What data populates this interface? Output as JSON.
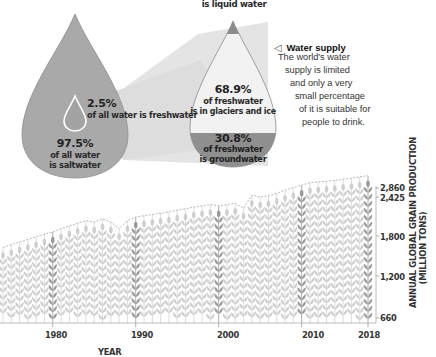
{
  "infographic": {
    "top_label": "is liquid water",
    "big_drop": {
      "freshwater_pct": "2.5%",
      "freshwater_desc": "of all water is freshwater",
      "saltwater_pct": "97.5%",
      "saltwater_desc_1": "of all water",
      "saltwater_desc_2": "is saltwater"
    },
    "fresh_drop": {
      "glaciers_pct": "68.9%",
      "glaciers_desc_1": "of freshwater",
      "glaciers_desc_2": "is in glaciers and ice",
      "ground_pct": "30.8%",
      "ground_desc_1": "of freshwater",
      "ground_desc_2": "is groundwater"
    },
    "water_supply": {
      "icon": "triangle-left-icon",
      "title": "Water supply",
      "lines": [
        "The world's water",
        "supply is limited",
        "and only a very",
        "small percentage",
        "of it is suitable for",
        "people to drink."
      ]
    },
    "colors": {
      "drop_gray": "#a9a9a9",
      "drop_dark": "#8c8c8c",
      "drop_light": "#f2f2f2",
      "funnel": "#e2e2e2",
      "wheat_light": "#cfcfcf",
      "wheat_dark": "#9a9a9a"
    }
  },
  "chart_data": {
    "type": "bar",
    "title": "",
    "xlabel": "YEAR",
    "ylabel": "ANNUAL GLOBAL GRAIN PRODUCTION",
    "ylabel_2": "(MILLION TONS)",
    "x_ticks": [
      "1980",
      "1990",
      "2000",
      "2010",
      "2018"
    ],
    "y_ticks": [
      "2,860",
      "2,425",
      "1,800",
      "1,200",
      "660"
    ],
    "highlighted_years": [
      1980,
      1990,
      2000,
      2010,
      2018
    ],
    "categories": [
      1974,
      1975,
      1976,
      1977,
      1978,
      1979,
      1980,
      1981,
      1982,
      1983,
      1984,
      1985,
      1986,
      1987,
      1988,
      1989,
      1990,
      1991,
      1992,
      1993,
      1994,
      1995,
      1996,
      1997,
      1998,
      1999,
      2000,
      2001,
      2002,
      2003,
      2004,
      2005,
      2006,
      2007,
      2008,
      2009,
      2010,
      2011,
      2012,
      2013,
      2014,
      2015,
      2016,
      2017,
      2018
    ],
    "values": [
      1420,
      1460,
      1500,
      1540,
      1580,
      1620,
      1650,
      1700,
      1740,
      1780,
      1820,
      1800,
      1850,
      1800,
      1700,
      1820,
      1880,
      1900,
      1920,
      1940,
      1960,
      1990,
      2010,
      2040,
      2060,
      2080,
      2060,
      2080,
      2100,
      2020,
      2230,
      2200,
      2220,
      2260,
      2310,
      2350,
      2390,
      2440,
      2480,
      2510,
      2550,
      2610,
      2650,
      2720,
      2780
    ],
    "ylim": [
      660,
      2860
    ],
    "grid": false,
    "legend": null
  }
}
